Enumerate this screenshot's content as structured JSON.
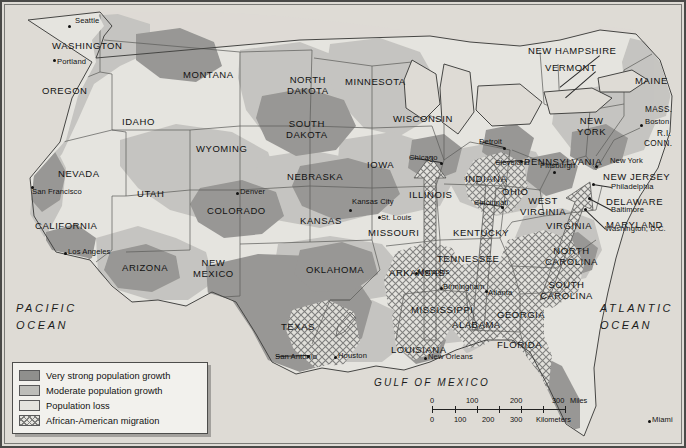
{
  "map": {
    "title": "United States population growth and African-American migration",
    "oceans": [
      {
        "name": "pacific",
        "line1": "PACIFIC",
        "line2": "OCEAN",
        "x": 16,
        "y": 300
      },
      {
        "name": "atlantic",
        "line1": "ATLANTIC",
        "line2": "OCEAN",
        "x": 600,
        "y": 300
      },
      {
        "name": "gulf",
        "line1": "GULF OF MEXICO",
        "line2": "",
        "x": 374,
        "y": 375
      }
    ],
    "states": [
      {
        "label": "WASHINGTON",
        "x": 52,
        "y": 41,
        "size": "normal"
      },
      {
        "label": "OREGON",
        "x": 42,
        "y": 86,
        "size": "normal"
      },
      {
        "label": "IDAHO",
        "x": 122,
        "y": 117,
        "size": "normal"
      },
      {
        "label": "MONTANA",
        "x": 183,
        "y": 70,
        "size": "normal"
      },
      {
        "label": "NORTH\nDAKOTA",
        "x": 287,
        "y": 75,
        "size": "normal"
      },
      {
        "label": "SOUTH\nDAKOTA",
        "x": 286,
        "y": 119,
        "size": "normal"
      },
      {
        "label": "WYOMING",
        "x": 196,
        "y": 144,
        "size": "normal"
      },
      {
        "label": "NEVADA",
        "x": 58,
        "y": 169,
        "size": "normal"
      },
      {
        "label": "UTAH",
        "x": 137,
        "y": 189,
        "size": "normal"
      },
      {
        "label": "COLORADO",
        "x": 207,
        "y": 206,
        "size": "normal"
      },
      {
        "label": "NEBRASKA",
        "x": 287,
        "y": 172,
        "size": "normal"
      },
      {
        "label": "KANSAS",
        "x": 300,
        "y": 216,
        "size": "normal"
      },
      {
        "label": "CALIFORNIA",
        "x": 35,
        "y": 221,
        "size": "normal"
      },
      {
        "label": "ARIZONA",
        "x": 122,
        "y": 263,
        "size": "normal"
      },
      {
        "label": "NEW\nMEXICO",
        "x": 193,
        "y": 258,
        "size": "normal"
      },
      {
        "label": "OKLAHOMA",
        "x": 306,
        "y": 265,
        "size": "normal"
      },
      {
        "label": "TEXAS",
        "x": 281,
        "y": 322,
        "size": "normal"
      },
      {
        "label": "MINNESOTA",
        "x": 345,
        "y": 77,
        "size": "normal"
      },
      {
        "label": "WISCONSIN",
        "x": 393,
        "y": 114,
        "size": "normal"
      },
      {
        "label": "IOWA",
        "x": 367,
        "y": 160,
        "size": "normal"
      },
      {
        "label": "ILLINOIS",
        "x": 409,
        "y": 190,
        "size": "normal"
      },
      {
        "label": "MISSOURI",
        "x": 368,
        "y": 228,
        "size": "normal"
      },
      {
        "label": "ARKANSAS",
        "x": 389,
        "y": 268,
        "size": "normal"
      },
      {
        "label": "LOUISIANA",
        "x": 391,
        "y": 345,
        "size": "normal"
      },
      {
        "label": "MISSISSIPPI",
        "x": 411,
        "y": 305,
        "size": "normal"
      },
      {
        "label": "ALABAMA",
        "x": 452,
        "y": 320,
        "size": "normal"
      },
      {
        "label": "TENNESSEE",
        "x": 437,
        "y": 254,
        "size": "normal"
      },
      {
        "label": "KENTUCKY",
        "x": 453,
        "y": 228,
        "size": "normal"
      },
      {
        "label": "INDIANA",
        "x": 465,
        "y": 174,
        "size": "normal"
      },
      {
        "label": "OHIO",
        "x": 502,
        "y": 187,
        "size": "normal"
      },
      {
        "label": "WEST\nVIRGINIA",
        "x": 520,
        "y": 196,
        "size": "normal"
      },
      {
        "label": "VIRGINIA",
        "x": 546,
        "y": 221,
        "size": "normal"
      },
      {
        "label": "NORTH\nCAROLINA",
        "x": 545,
        "y": 246,
        "size": "normal"
      },
      {
        "label": "SOUTH\nCAROLINA",
        "x": 540,
        "y": 280,
        "size": "normal"
      },
      {
        "label": "GEORGIA",
        "x": 497,
        "y": 310,
        "size": "normal"
      },
      {
        "label": "FLORIDA",
        "x": 497,
        "y": 340,
        "size": "normal"
      },
      {
        "label": "PENNSYLVANIA",
        "x": 524,
        "y": 157,
        "size": "normal"
      },
      {
        "label": "NEW\nYORK",
        "x": 577,
        "y": 116,
        "size": "normal"
      },
      {
        "label": "NEW HAMPSHIRE",
        "x": 528,
        "y": 46,
        "size": "normal"
      },
      {
        "label": "VERMONT",
        "x": 545,
        "y": 63,
        "size": "normal"
      },
      {
        "label": "MAINE",
        "x": 635,
        "y": 76,
        "size": "normal"
      },
      {
        "label": "MASS.",
        "x": 645,
        "y": 106,
        "size": "small"
      },
      {
        "label": "R.I.",
        "x": 657,
        "y": 130,
        "size": "small"
      },
      {
        "label": "CONN.",
        "x": 644,
        "y": 140,
        "size": "small"
      },
      {
        "label": "NEW JERSEY",
        "x": 603,
        "y": 172,
        "size": "normal"
      },
      {
        "label": "DELAWARE",
        "x": 606,
        "y": 197,
        "size": "normal"
      },
      {
        "label": "MARYLAND",
        "x": 606,
        "y": 220,
        "size": "normal"
      }
    ],
    "cities": [
      {
        "label": "Seattle",
        "lx": 75,
        "ly": 21,
        "dx": 68,
        "dy": 25
      },
      {
        "label": "Portland",
        "lx": 57,
        "ly": 62,
        "dx": 53,
        "dy": 59
      },
      {
        "label": "San Francisco",
        "lx": 32,
        "ly": 192,
        "dx": 31,
        "dy": 186
      },
      {
        "label": "Los Angeles",
        "lx": 68,
        "ly": 252,
        "dx": 64,
        "dy": 252
      },
      {
        "label": "Denver",
        "lx": 240,
        "ly": 192,
        "dx": 236,
        "dy": 192
      },
      {
        "label": "Kansas City",
        "lx": 352,
        "ly": 202,
        "dx": 349,
        "dy": 209
      },
      {
        "label": "St. Louis",
        "lx": 381,
        "ly": 218,
        "dx": 378,
        "dy": 216
      },
      {
        "label": "Chicago",
        "lx": 409,
        "ly": 158,
        "dx": 440,
        "dy": 162
      },
      {
        "label": "Detroit",
        "lx": 479,
        "ly": 142,
        "dx": 503,
        "dy": 147
      },
      {
        "label": "Cleveland",
        "lx": 495,
        "ly": 163,
        "dx": 520,
        "dy": 160
      },
      {
        "label": "Cincinnati",
        "lx": 474,
        "ly": 203,
        "dx": 501,
        "dy": 206
      },
      {
        "label": "Pittsburgh",
        "lx": 540,
        "ly": 166,
        "dx": 553,
        "dy": 171
      },
      {
        "label": "Boston",
        "lx": 645,
        "ly": 122,
        "dx": 640,
        "dy": 124
      },
      {
        "label": "New York",
        "lx": 610,
        "ly": 161,
        "dx": 595,
        "dy": 165
      },
      {
        "label": "Philadelphia",
        "lx": 611,
        "ly": 187,
        "dx": 592,
        "dy": 183
      },
      {
        "label": "Baltimore",
        "lx": 611,
        "ly": 210,
        "dx": 588,
        "dy": 197
      },
      {
        "label": "Washington, D.C.",
        "lx": 605,
        "ly": 229,
        "dx": 584,
        "dy": 208
      },
      {
        "label": "Memphis",
        "lx": 418,
        "ly": 272,
        "dx": 415,
        "dy": 272
      },
      {
        "label": "Birmingham",
        "lx": 443,
        "ly": 287,
        "dx": 440,
        "dy": 287
      },
      {
        "label": "Atlanta",
        "lx": 488,
        "ly": 293,
        "dx": 485,
        "dy": 290
      },
      {
        "label": "New Orleans",
        "lx": 428,
        "ly": 357,
        "dx": 424,
        "dy": 357
      },
      {
        "label": "Houston",
        "lx": 338,
        "ly": 356,
        "dx": 334,
        "dy": 356
      },
      {
        "label": "San Antonio",
        "lx": 275,
        "ly": 357,
        "dx": 307,
        "dy": 355
      },
      {
        "label": "Miami",
        "lx": 652,
        "ly": 420,
        "dx": 648,
        "dy": 420
      }
    ]
  },
  "legend": {
    "items": [
      {
        "swatch": "very-strong",
        "label": "Very strong population growth",
        "color": "#8f8f8d"
      },
      {
        "swatch": "moderate",
        "label": "Moderate population growth",
        "color": "#bdbdb9"
      },
      {
        "swatch": "loss",
        "label": "Population loss",
        "color": "#e4e3de"
      },
      {
        "swatch": "migration",
        "label": "African-American migration",
        "color": "#7e7e7c"
      }
    ]
  },
  "scalebar": {
    "miles": {
      "ticks": [
        "0",
        "100",
        "200",
        "300"
      ],
      "unit": "Miles"
    },
    "kilometers": {
      "ticks": [
        "0",
        "100",
        "200",
        "300"
      ],
      "unit": "Kilometers"
    }
  },
  "colors": {
    "very_strong": "#8f8f8d",
    "moderate": "#bdbdb9",
    "loss": "#e4e3de",
    "ocean": "#dedbd5",
    "border": "#4a4a48",
    "hatch": "#7e7e7c"
  }
}
